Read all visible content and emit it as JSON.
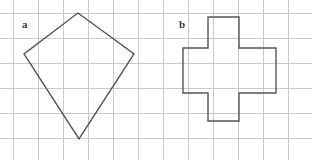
{
  "figure": {
    "width": 312,
    "height": 160,
    "background_color": "#ffffff",
    "grid": {
      "visible": true,
      "cell_size": 25,
      "origin_x": 13,
      "origin_y": 13,
      "line_color": "#c9c9c9",
      "line_width": 1,
      "columns": 12,
      "rows": 6
    },
    "shapes": [
      {
        "id": "a",
        "label": "a",
        "name": "kite-quadrilateral",
        "type": "polygon",
        "sides": 4,
        "stroke_color": "#555555",
        "stroke_width": 1.4,
        "fill": "none",
        "label_position": {
          "x": 22,
          "y": 19
        },
        "points": [
          {
            "x": 78,
            "y": 13
          },
          {
            "x": 134,
            "y": 54
          },
          {
            "x": 79,
            "y": 139
          },
          {
            "x": 24,
            "y": 54
          }
        ],
        "points_svg": "78,13 134,54 79,139 24,54"
      },
      {
        "id": "b",
        "label": "b",
        "name": "cross-dodecagon",
        "type": "polygon",
        "sides": 12,
        "stroke_color": "#555555",
        "stroke_width": 1.4,
        "fill": "none",
        "label_position": {
          "x": 179,
          "y": 19
        },
        "points": [
          {
            "x": 208,
            "y": 17
          },
          {
            "x": 239,
            "y": 17
          },
          {
            "x": 239,
            "y": 48
          },
          {
            "x": 276,
            "y": 48
          },
          {
            "x": 276,
            "y": 93
          },
          {
            "x": 239,
            "y": 93
          },
          {
            "x": 239,
            "y": 121
          },
          {
            "x": 208,
            "y": 121
          },
          {
            "x": 208,
            "y": 93
          },
          {
            "x": 183,
            "y": 93
          },
          {
            "x": 183,
            "y": 48
          },
          {
            "x": 208,
            "y": 48
          }
        ],
        "points_svg": "208,17 239,17 239,48 276,48 276,93 239,93 239,121 208,121 208,93 183,93 183,48 208,48"
      }
    ]
  }
}
